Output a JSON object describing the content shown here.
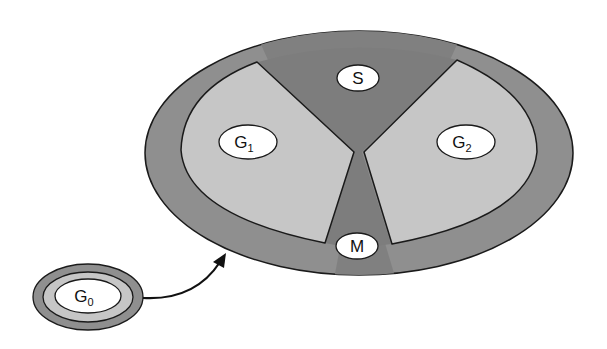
{
  "diagram": {
    "type": "cell-cycle",
    "phases": [
      {
        "id": "G1",
        "label": "G",
        "subscript": "1"
      },
      {
        "id": "S",
        "label": "S",
        "subscript": ""
      },
      {
        "id": "G2",
        "label": "G",
        "subscript": "2"
      },
      {
        "id": "M",
        "label": "M",
        "subscript": ""
      }
    ],
    "quiescent": {
      "id": "G0",
      "label": "G",
      "subscript": "0"
    },
    "arrow": {
      "from": "G0",
      "to": "cycle"
    },
    "colors": {
      "outer_ring": "#8f8f8f",
      "dark_sector": "#7d7d7d",
      "light_sector": "#c6c6c6",
      "label_bg": "#ffffff",
      "stroke": "#1a1a1a"
    }
  }
}
